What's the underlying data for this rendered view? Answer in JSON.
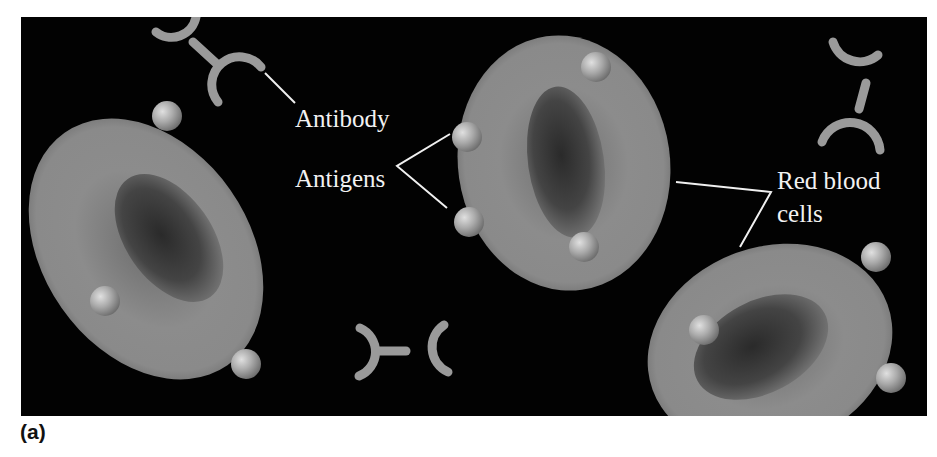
{
  "figure": {
    "panel_label": "(a)",
    "background_color": "#020202",
    "cell_color": "#8a8a8a",
    "antigen_color": "#b4b4b4",
    "antibody_color": "#9a9a9a",
    "label_color": "#f2f2f2"
  },
  "labels": {
    "antibody": "Antibody",
    "antigens": "Antigens",
    "red_blood_cells_line1": "Red blood",
    "red_blood_cells_line2": "cells"
  },
  "elements": {
    "red_blood_cells": [
      {
        "id": "left",
        "antigens": 3
      },
      {
        "id": "center",
        "antigens": 4
      },
      {
        "id": "bottom-right",
        "antigens": 3
      }
    ],
    "antibodies": [
      {
        "id": "top-left"
      },
      {
        "id": "top-right"
      },
      {
        "id": "bottom-center"
      }
    ]
  }
}
